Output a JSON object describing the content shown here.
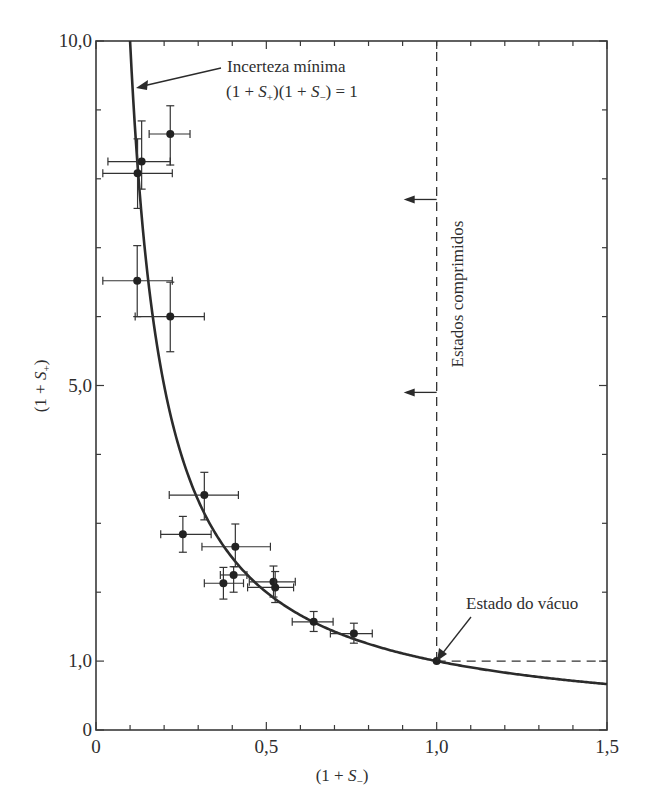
{
  "chart_data": {
    "type": "scatter",
    "title": "",
    "xlabel": "(1 + S₋)",
    "ylabel": "(1 + S₊)",
    "xlim": [
      0,
      1.5
    ],
    "ylim": [
      0,
      10
    ],
    "x_ticks": [
      {
        "value": 0,
        "label": "0"
      },
      {
        "value": 0.5,
        "label": "0,5"
      },
      {
        "value": 1.0,
        "label": "1,0"
      },
      {
        "value": 1.5,
        "label": "1,5"
      }
    ],
    "x_minor_step": 0.1,
    "y_ticks": [
      {
        "value": 0,
        "label": "0"
      },
      {
        "value": 1.0,
        "label": "1,0"
      },
      {
        "value": 5.0,
        "label": "5,0"
      },
      {
        "value": 10.0,
        "label": "10,0"
      }
    ],
    "y_minor_step": 1.0,
    "grid": false,
    "legend": null,
    "series": [
      {
        "name": "Medidas experimentais",
        "kind": "scatter_errorbars",
        "points": [
          {
            "x": 0.218,
            "y": 8.65,
            "xerr": [
              0.156,
              0.276
            ],
            "yerr": [
              8.2,
              9.06
            ]
          },
          {
            "x": 0.134,
            "y": 8.25,
            "xerr": [
              0.035,
              0.218
            ],
            "yerr": [
              7.85,
              8.84
            ]
          },
          {
            "x": 0.122,
            "y": 8.08,
            "xerr": [
              0.02,
              0.224
            ],
            "yerr": [
              7.57,
              8.58
            ]
          },
          {
            "x": 0.121,
            "y": 6.52,
            "xerr": [
              0.02,
              0.224
            ],
            "yerr": [
              6.0,
              7.03
            ]
          },
          {
            "x": 0.218,
            "y": 6.0,
            "xerr": [
              0.115,
              0.318
            ],
            "yerr": [
              5.49,
              6.5
            ]
          },
          {
            "x": 0.318,
            "y": 3.41,
            "xerr": [
              0.215,
              0.418
            ],
            "yerr": [
              3.05,
              3.74
            ]
          },
          {
            "x": 0.255,
            "y": 2.84,
            "xerr": [
              0.19,
              0.338
            ],
            "yerr": [
              2.58,
              3.1
            ]
          },
          {
            "x": 0.409,
            "y": 2.66,
            "xerr": [
              0.311,
              0.512
            ],
            "yerr": [
              2.37,
              2.99
            ]
          },
          {
            "x": 0.404,
            "y": 2.25,
            "xerr": [
              0.365,
              0.443
            ],
            "yerr": [
              2.0,
              2.37
            ]
          },
          {
            "x": 0.374,
            "y": 2.13,
            "xerr": [
              0.318,
              0.433
            ],
            "yerr": [
              1.9,
              2.36
            ]
          },
          {
            "x": 0.521,
            "y": 2.15,
            "xerr": [
              0.45,
              0.585
            ],
            "yerr": [
              1.93,
              2.38
            ]
          },
          {
            "x": 0.526,
            "y": 2.07,
            "xerr": [
              0.445,
              0.58
            ],
            "yerr": [
              1.85,
              2.3
            ]
          },
          {
            "x": 0.639,
            "y": 1.57,
            "xerr": [
              0.576,
              0.696
            ],
            "yerr": [
              1.43,
              1.72
            ]
          },
          {
            "x": 0.757,
            "y": 1.4,
            "xerr": [
              0.688,
              0.811
            ],
            "yerr": [
              1.26,
              1.55
            ]
          },
          {
            "x": 1.0,
            "y": 1.0,
            "xerr": null,
            "yerr": null
          }
        ]
      },
      {
        "name": "Incerteza mínima (1 + S₊)(1 + S₋) = 1",
        "kind": "line",
        "function": "y = 1/x",
        "x_range": [
          0.1,
          1.5
        ]
      },
      {
        "name": "Limite de estados comprimidos",
        "kind": "dashed_lines",
        "segments": [
          {
            "x1": 1.0,
            "y1": 1.0,
            "x2": 1.0,
            "y2": 10.0
          },
          {
            "x1": 1.0,
            "y1": 1.0,
            "x2": 1.5,
            "y2": 1.0
          }
        ]
      }
    ],
    "annotations": [
      {
        "id": "min-uncertainty",
        "line1": "Incerteza mínima",
        "line2_parts": [
          "(1 + ",
          "S",
          "+",
          ")(1 + ",
          "S",
          "−",
          ") = 1"
        ],
        "text": "Incerteza mínima (1 + S₊)(1 + S₋) = 1",
        "arrow_to": {
          "x": 0.12,
          "y": 9.3
        }
      },
      {
        "id": "squeezed-states",
        "text": "Estados comprimidos",
        "rotated": -90,
        "arrows_at_y": [
          7.7,
          4.9
        ],
        "arrow_direction": "left"
      },
      {
        "id": "vacuum-state",
        "text": "Estado do vácuo",
        "arrow_to": {
          "x": 1.0,
          "y": 1.0
        }
      }
    ]
  }
}
